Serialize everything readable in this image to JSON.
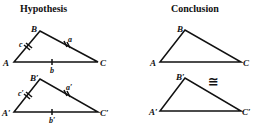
{
  "headings": {
    "hypothesis": "Hypothesis",
    "conclusion": "Conclusion"
  },
  "symbols": {
    "congruent": "≅"
  },
  "triangles": {
    "hyp_top": {
      "vertices": {
        "A": "A",
        "B": "B",
        "C": "C"
      },
      "sides": {
        "a": "a",
        "b": "b",
        "c": "c"
      },
      "tick_marks": {
        "a": 2,
        "b": 1,
        "c": 2
      }
    },
    "hyp_bottom": {
      "vertices": {
        "A": "A′",
        "B": "B′",
        "C": "C′"
      },
      "sides": {
        "a": "a′",
        "b": "b′",
        "c": "c′"
      },
      "tick_marks": {
        "a": 2,
        "b": 1,
        "c": 2
      }
    },
    "con_top": {
      "vertices": {
        "A": "A",
        "B": "B",
        "C": "C"
      }
    },
    "con_bottom": {
      "vertices": {
        "A": "A′",
        "B": "B′",
        "C": "C′"
      }
    }
  },
  "colors": {
    "ink": "#111111",
    "background": "#ffffff"
  }
}
